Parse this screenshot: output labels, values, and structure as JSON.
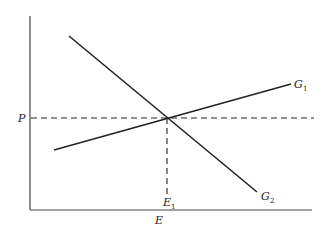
{
  "diagram": {
    "title": "",
    "axes": {
      "y_label": "P",
      "x_label": "E"
    },
    "lines": [
      {
        "id": "G1",
        "label": "G",
        "subscript": "1",
        "description": "upward-sloping line"
      },
      {
        "id": "G2",
        "label": "G",
        "subscript": "2",
        "description": "downward-sloping line"
      }
    ],
    "equilibrium": {
      "label": "E",
      "subscript": "1",
      "price_level_label": "P"
    },
    "colors": {
      "line": "#222222",
      "axis": "#444444",
      "background": "#ffffff"
    }
  }
}
